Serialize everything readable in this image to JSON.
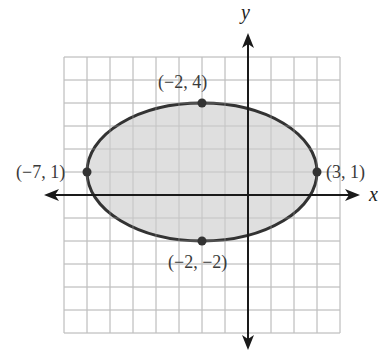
{
  "figure": {
    "type": "ellipse-graph",
    "axes": {
      "x_label": "x",
      "y_label": "y",
      "x_range": [
        -8,
        4
      ],
      "y_range": [
        -6,
        6
      ],
      "grid_step": 1
    },
    "ellipse": {
      "center": [
        -2,
        1
      ],
      "semi_major_x": 5,
      "semi_minor_y": 3,
      "fill": "#d9d9d9",
      "stroke": "#333333"
    },
    "points": [
      {
        "x": -2,
        "y": 4,
        "label": "(−2, 4)"
      },
      {
        "x": -7,
        "y": 1,
        "label": "(−7, 1)"
      },
      {
        "x": 3,
        "y": 1,
        "label": "(3, 1)"
      },
      {
        "x": -2,
        "y": -2,
        "label": "(−2, −2)"
      }
    ],
    "colors": {
      "grid": "#c8c8c8",
      "axis": "#1a1a1a",
      "point": "#333333"
    }
  }
}
